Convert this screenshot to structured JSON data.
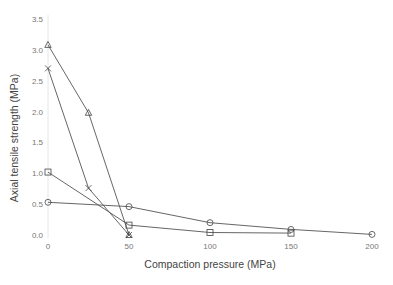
{
  "chart_data": {
    "type": "line",
    "title": "",
    "xlabel": "Compaction pressure (MPa)",
    "ylabel": "Axial tensile strength (MPa)",
    "xlim": [
      0,
      200
    ],
    "ylim": [
      0,
      3.5
    ],
    "xticks": [
      0,
      50,
      100,
      150,
      200
    ],
    "xtick_labels": [
      "0",
      "50",
      "100",
      "150",
      "200"
    ],
    "yticks": [
      0,
      0.5,
      1.0,
      1.5,
      2.0,
      2.5,
      3.0,
      3.5
    ],
    "ytick_labels": [
      "0.0",
      "0.5",
      "1.0",
      "1.5",
      "2.0",
      "2.5",
      "3.0",
      "3.5"
    ],
    "grid": false,
    "legend": "none",
    "series": [
      {
        "name": "triangle-series",
        "marker": "triangle",
        "x": [
          0,
          25,
          50
        ],
        "values": [
          3.08,
          1.98,
          0.0
        ]
      },
      {
        "name": "cross-series",
        "marker": "cross",
        "x": [
          0,
          25,
          50
        ],
        "values": [
          2.7,
          0.76,
          0.0
        ]
      },
      {
        "name": "square-series",
        "marker": "square",
        "x": [
          0,
          50,
          100,
          150
        ],
        "values": [
          1.02,
          0.16,
          0.04,
          0.03
        ]
      },
      {
        "name": "circle-series",
        "marker": "circle",
        "x": [
          0,
          50,
          100,
          150,
          200
        ],
        "values": [
          0.53,
          0.46,
          0.2,
          0.09,
          0.01
        ]
      }
    ]
  }
}
